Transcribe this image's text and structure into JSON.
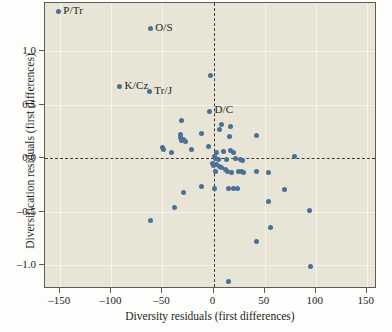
{
  "chart_data": {
    "type": "scatter",
    "title": "",
    "xlabel": "Diversity residuals (first differences)",
    "ylabel": "Diversification residuals (first differences)",
    "xlim": [
      -165,
      160
    ],
    "ylim": [
      -1.22,
      1.45
    ],
    "xticks": [
      -150,
      -100,
      -50,
      0,
      50,
      100,
      150
    ],
    "xticklabels": [
      "–150",
      "–100",
      "–50",
      "0",
      "50",
      "100",
      "150"
    ],
    "yticks": [
      1.0,
      0.5,
      0.0,
      -0.5,
      -1.0
    ],
    "yticklabels": [
      "1.0",
      "0.5",
      "0.0",
      "–0.5",
      "–1.0"
    ],
    "grid": true,
    "legend": null,
    "reference_lines": [
      {
        "orientation": "vertical",
        "value": 0,
        "style": "dashed"
      },
      {
        "orientation": "horizontal",
        "value": 0,
        "style": "dashed"
      }
    ],
    "marker_color": "#4a7096",
    "plot_background": "#e9e5d6",
    "points": [
      {
        "x": -152,
        "y": 1.37,
        "label": "P/Tr"
      },
      {
        "x": -62,
        "y": 1.21,
        "label": "O/S"
      },
      {
        "x": -92,
        "y": 0.67,
        "label": "K/Cz"
      },
      {
        "x": -63,
        "y": 0.62,
        "label": "Tr/J"
      },
      {
        "x": -4,
        "y": 0.44,
        "label": "D/C"
      },
      {
        "x": -3,
        "y": 0.77,
        "label": null
      },
      {
        "x": -31,
        "y": 0.35,
        "label": null
      },
      {
        "x": -32,
        "y": 0.22,
        "label": null
      },
      {
        "x": -32,
        "y": 0.19,
        "label": null
      },
      {
        "x": -31,
        "y": 0.17,
        "label": null
      },
      {
        "x": -29,
        "y": 0.18,
        "label": null
      },
      {
        "x": -27,
        "y": 0.16,
        "label": null
      },
      {
        "x": -12,
        "y": 0.23,
        "label": null
      },
      {
        "x": -50,
        "y": 0.1,
        "label": null
      },
      {
        "x": -49,
        "y": 0.08,
        "label": null
      },
      {
        "x": -41,
        "y": 0.05,
        "label": null
      },
      {
        "x": -22,
        "y": 0.08,
        "label": null
      },
      {
        "x": -5,
        "y": 0.11,
        "label": null
      },
      {
        "x": 8,
        "y": 0.32,
        "label": null
      },
      {
        "x": 6,
        "y": 0.27,
        "label": null
      },
      {
        "x": 17,
        "y": 0.3,
        "label": null
      },
      {
        "x": 16,
        "y": 0.2,
        "label": null
      },
      {
        "x": 42,
        "y": 0.21,
        "label": null
      },
      {
        "x": 3,
        "y": 0.05,
        "label": null
      },
      {
        "x": 10,
        "y": 0.06,
        "label": null
      },
      {
        "x": 17,
        "y": 0.07,
        "label": null
      },
      {
        "x": 20,
        "y": 0.05,
        "label": null
      },
      {
        "x": 1,
        "y": 0.02,
        "label": null
      },
      {
        "x": 2,
        "y": 0.0,
        "label": null
      },
      {
        "x": 5,
        "y": -0.01,
        "label": null
      },
      {
        "x": 13,
        "y": -0.01,
        "label": null
      },
      {
        "x": 21,
        "y": 0.0,
        "label": null
      },
      {
        "x": 26,
        "y": -0.01,
        "label": null
      },
      {
        "x": 28,
        "y": -0.02,
        "label": null
      },
      {
        "x": 79,
        "y": 0.02,
        "label": null
      },
      {
        "x": -1,
        "y": -0.05,
        "label": null
      },
      {
        "x": 0,
        "y": -0.07,
        "label": null
      },
      {
        "x": 3,
        "y": -0.06,
        "label": null
      },
      {
        "x": 6,
        "y": -0.08,
        "label": null
      },
      {
        "x": 8,
        "y": -0.09,
        "label": null
      },
      {
        "x": 12,
        "y": -0.1,
        "label": null
      },
      {
        "x": 14,
        "y": -0.12,
        "label": null
      },
      {
        "x": 18,
        "y": -0.13,
        "label": null
      },
      {
        "x": 24,
        "y": -0.12,
        "label": null
      },
      {
        "x": 27,
        "y": -0.12,
        "label": null
      },
      {
        "x": 29,
        "y": -0.13,
        "label": null
      },
      {
        "x": 2,
        "y": -0.12,
        "label": null
      },
      {
        "x": 42,
        "y": -0.12,
        "label": null
      },
      {
        "x": 54,
        "y": -0.13,
        "label": null
      },
      {
        "x": -12,
        "y": -0.26,
        "label": null
      },
      {
        "x": 1,
        "y": -0.28,
        "label": null
      },
      {
        "x": 15,
        "y": -0.28,
        "label": null
      },
      {
        "x": 20,
        "y": -0.28,
        "label": null
      },
      {
        "x": 23,
        "y": -0.28,
        "label": null
      },
      {
        "x": 69,
        "y": -0.29,
        "label": null
      },
      {
        "x": -29,
        "y": -0.32,
        "label": null
      },
      {
        "x": 54,
        "y": -0.4,
        "label": null
      },
      {
        "x": -38,
        "y": -0.46,
        "label": null
      },
      {
        "x": 94,
        "y": -0.49,
        "label": null
      },
      {
        "x": -62,
        "y": -0.58,
        "label": null
      },
      {
        "x": 56,
        "y": -0.65,
        "label": null
      },
      {
        "x": 42,
        "y": -0.78,
        "label": null
      },
      {
        "x": 95,
        "y": -1.01,
        "label": null
      },
      {
        "x": 15,
        "y": -1.15,
        "label": null
      }
    ]
  }
}
